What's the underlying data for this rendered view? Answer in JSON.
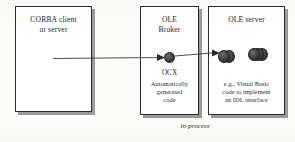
{
  "diagram": {
    "caption": "in-process",
    "boxes": [
      {
        "id": "corba",
        "title_line1": "CORBA client",
        "title_line2": "or server"
      },
      {
        "id": "broker",
        "title_line1": "OLE",
        "title_line2": "Broker",
        "component_label": "OCX",
        "note_line1": "Automatically",
        "note_line2": "generated",
        "note_line3": "code"
      },
      {
        "id": "oleserver",
        "title_line1": "OLE server",
        "note_line1": "e.g., Visual Basic",
        "note_line2": "code to implement",
        "note_line3": "an IDL interface"
      }
    ],
    "colors": {
      "box_border": "#2b2b2b",
      "box_shadow": "#9a9a9a",
      "connector": "#3a3a3a",
      "component_ball": "#3a3a3a",
      "paper": "#fbfbf9"
    }
  }
}
